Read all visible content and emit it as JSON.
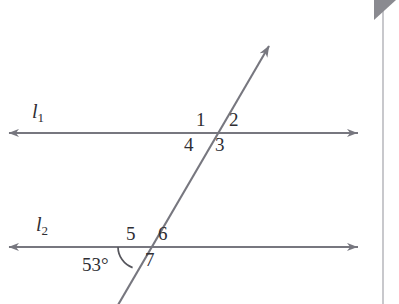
{
  "figure": {
    "background_color": "#ffffff",
    "stroke_color": "#77777f",
    "label_color": "#2e2e33",
    "width": 399,
    "height": 304
  },
  "lines": [
    {
      "name": "line-l1",
      "label": "l",
      "subscript": "1",
      "kind": "horizontal",
      "y": 133,
      "x_start": 8,
      "x_end": 358,
      "arrow_start": true,
      "arrow_end": true
    },
    {
      "name": "line-l2",
      "label": "l",
      "subscript": "2",
      "kind": "horizontal",
      "y": 247,
      "x_start": 8,
      "x_end": 358,
      "arrow_start": true,
      "arrow_end": true
    },
    {
      "name": "transversal",
      "label": "",
      "subscript": "",
      "kind": "transversal",
      "x_top": 270,
      "y_top": 45,
      "x_bottom": 118,
      "y_bottom": 304,
      "arrow_start": false,
      "arrow_end": true
    }
  ],
  "intersections": [
    {
      "name": "upper-intersection",
      "x": 210,
      "y": 133,
      "on_line": "l1"
    },
    {
      "name": "lower-intersection",
      "x": 140,
      "y": 247,
      "on_line": "l2"
    }
  ],
  "angle_labels": [
    {
      "id": "1",
      "text": "1",
      "x": 196,
      "y": 110,
      "position": "upper-left-of-upper-intersection"
    },
    {
      "id": "2",
      "text": "2",
      "x": 229,
      "y": 110,
      "position": "upper-right-of-upper-intersection"
    },
    {
      "id": "3",
      "text": "3",
      "x": 215,
      "y": 135,
      "position": "lower-right-of-upper-intersection"
    },
    {
      "id": "4",
      "text": "4",
      "x": 184,
      "y": 135,
      "position": "lower-left-of-upper-intersection"
    },
    {
      "id": "5",
      "text": "5",
      "x": 126,
      "y": 224,
      "position": "upper-left-of-lower-intersection"
    },
    {
      "id": "6",
      "text": "6",
      "x": 158,
      "y": 224,
      "position": "upper-right-of-lower-intersection"
    },
    {
      "id": "7",
      "text": "7",
      "x": 145,
      "y": 250,
      "position": "lower-right-of-lower-intersection"
    }
  ],
  "measured_angle": {
    "name": "angle-53-degrees",
    "text": "53°",
    "value": 53,
    "unit": "degrees",
    "x": 82,
    "y": 255,
    "vertex_x": 140,
    "vertex_y": 247,
    "arc_radius": 22
  },
  "line_label_positions": [
    {
      "for": "l1",
      "x": 32,
      "y": 101
    },
    {
      "for": "l2",
      "x": 36,
      "y": 214
    }
  ],
  "scan_artifacts": {
    "vertical_rule_x": 382,
    "vertical_rule_top": 8,
    "vertical_rule_height": 296,
    "corner_triangle": {
      "x": 374,
      "y": 0,
      "size": 22,
      "color": "#8a8a90"
    }
  }
}
